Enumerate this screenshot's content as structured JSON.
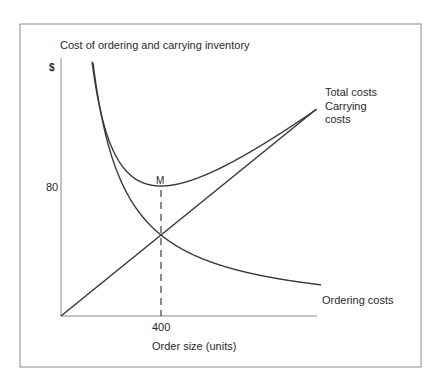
{
  "chart_data": {
    "type": "line",
    "title": "Cost of ordering and carrying inventory",
    "xlabel": "Order size (units)",
    "ylabel": "$",
    "x_ticks": [
      400
    ],
    "y_ticks": [
      80
    ],
    "xlim": [
      0,
      1025
    ],
    "ylim": [
      0,
      160
    ],
    "grid": false,
    "legend_position": "inline-right",
    "series": [
      {
        "name": "Total costs",
        "formula": "0.1*Q + 16000/Q",
        "x": [
          100,
          150,
          200,
          300,
          400,
          500,
          600,
          800,
          1000
        ],
        "values": [
          170,
          121.7,
          100,
          83.3,
          80,
          82,
          86.7,
          100,
          116
        ]
      },
      {
        "name": "Carrying costs",
        "formula": "0.1*Q",
        "x": [
          0,
          200,
          400,
          600,
          800,
          1000
        ],
        "values": [
          0,
          20,
          40,
          60,
          80,
          100
        ]
      },
      {
        "name": "Ordering costs",
        "formula": "16000/Q",
        "x": [
          100,
          150,
          200,
          300,
          400,
          500,
          600,
          800,
          1000
        ],
        "values": [
          160,
          106.7,
          80,
          53.3,
          40,
          32,
          26.7,
          20,
          16
        ]
      }
    ],
    "annotations": [
      {
        "text": "M",
        "x": 400,
        "y": 80,
        "note": "minimum total cost point"
      },
      {
        "type": "dashed-vertical",
        "x": 400
      }
    ]
  },
  "labels": {
    "title": "Cost of ordering and carrying inventory",
    "y_unit": "$",
    "y_tick_80": "80",
    "x_tick_400": "400",
    "x_axis": "Order size (units)",
    "min_point": "M",
    "total": "Total costs",
    "carrying_1": "Carrying",
    "carrying_2": "costs",
    "ordering": "Ordering costs"
  },
  "colors": {
    "line": "#3a3a3a",
    "frame": "#8a8a8a",
    "text": "#2a2a2a"
  }
}
